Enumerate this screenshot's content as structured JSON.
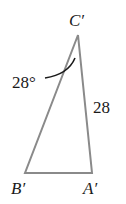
{
  "diagram": {
    "type": "triangle",
    "vertices": {
      "C": {
        "label": "C′"
      },
      "B": {
        "label": "B′"
      },
      "A": {
        "label": "A′"
      }
    },
    "angle_label": "28°",
    "side_label": "28",
    "colors": {
      "stroke": "#8a8a8a",
      "text": "#1a1a1a"
    }
  }
}
